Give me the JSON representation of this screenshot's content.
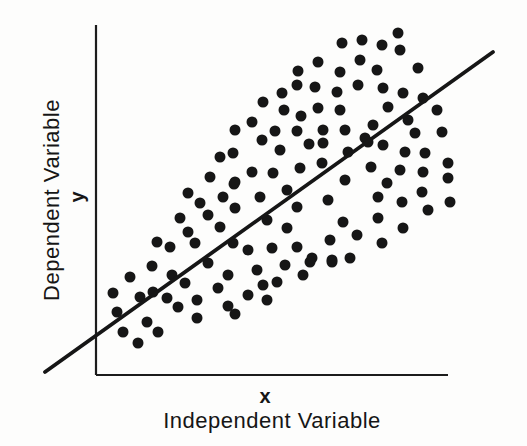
{
  "chart_data": {
    "type": "scatter",
    "title": "",
    "xlabel": "Independent Variable",
    "x_symbol": "x",
    "ylabel": "Dependent Variable",
    "y_symbol": "y",
    "legend": "none",
    "grid": false,
    "axes_note": "conceptual diagram: no ticks, no numeric scale; positive linear trend line through widening scatter cloud",
    "colors": {
      "background": "#fdfdfc",
      "ink": "#161616"
    },
    "axis_px": {
      "y_axis": {
        "x": 96,
        "y_top": 25,
        "y_bottom": 375
      },
      "x_axis": {
        "y": 375,
        "x_left": 96,
        "x_right": 448
      }
    },
    "trend_line_px": {
      "x1": 45,
      "y1": 372,
      "x2": 493,
      "y2": 52
    },
    "marker": {
      "shape": "circle",
      "radius_px": 5.5,
      "color": "#161616"
    },
    "labels_px": {
      "ylabel_center": {
        "x": 51,
        "y": 200
      },
      "y_symbol_center": {
        "x": 77,
        "y": 197
      },
      "x_symbol_center": {
        "x": 265,
        "y": 396
      },
      "xlabel_center": {
        "x": 272,
        "y": 417
      }
    },
    "points_px": [
      [
        398,
        33
      ],
      [
        342,
        43
      ],
      [
        362,
        40
      ],
      [
        382,
        45
      ],
      [
        400,
        50
      ],
      [
        318,
        62
      ],
      [
        360,
        60
      ],
      [
        298,
        71
      ],
      [
        340,
        72
      ],
      [
        377,
        70
      ],
      [
        418,
        68
      ],
      [
        297,
        85
      ],
      [
        315,
        87
      ],
      [
        337,
        92
      ],
      [
        358,
        85
      ],
      [
        282,
        93
      ],
      [
        383,
        88
      ],
      [
        403,
        93
      ],
      [
        423,
        98
      ],
      [
        263,
        102
      ],
      [
        284,
        110
      ],
      [
        318,
        108
      ],
      [
        340,
        110
      ],
      [
        388,
        107
      ],
      [
        437,
        110
      ],
      [
        252,
        122
      ],
      [
        301,
        116
      ],
      [
        235,
        130
      ],
      [
        275,
        131
      ],
      [
        297,
        131
      ],
      [
        323,
        130
      ],
      [
        345,
        130
      ],
      [
        373,
        125
      ],
      [
        408,
        120
      ],
      [
        415,
        133
      ],
      [
        442,
        132
      ],
      [
        262,
        140
      ],
      [
        309,
        144
      ],
      [
        365,
        138
      ],
      [
        280,
        150
      ],
      [
        323,
        143
      ],
      [
        348,
        152
      ],
      [
        368,
        142
      ],
      [
        383,
        145
      ],
      [
        405,
        152
      ],
      [
        425,
        153
      ],
      [
        448,
        163
      ],
      [
        220,
        157
      ],
      [
        233,
        153
      ],
      [
        210,
        177
      ],
      [
        188,
        193
      ],
      [
        234,
        184
      ],
      [
        252,
        172
      ],
      [
        273,
        173
      ],
      [
        300,
        168
      ],
      [
        322,
        163
      ],
      [
        345,
        180
      ],
      [
        371,
        167
      ],
      [
        400,
        170
      ],
      [
        423,
        172
      ],
      [
        448,
        178
      ],
      [
        235,
        182
      ],
      [
        287,
        190
      ],
      [
        387,
        183
      ],
      [
        422,
        192
      ],
      [
        200,
        203
      ],
      [
        223,
        197
      ],
      [
        180,
        218
      ],
      [
        208,
        215
      ],
      [
        220,
        227
      ],
      [
        260,
        197
      ],
      [
        297,
        207
      ],
      [
        235,
        208
      ],
      [
        267,
        220
      ],
      [
        287,
        228
      ],
      [
        328,
        200
      ],
      [
        343,
        222
      ],
      [
        378,
        197
      ],
      [
        402,
        202
      ],
      [
        450,
        202
      ],
      [
        428,
        210
      ],
      [
        378,
        218
      ],
      [
        403,
        228
      ],
      [
        330,
        240
      ],
      [
        357,
        235
      ],
      [
        382,
        243
      ],
      [
        248,
        250
      ],
      [
        272,
        248
      ],
      [
        297,
        247
      ],
      [
        312,
        258
      ],
      [
        332,
        260
      ],
      [
        350,
        258
      ],
      [
        157,
        242
      ],
      [
        170,
        247
      ],
      [
        195,
        243
      ],
      [
        188,
        232
      ],
      [
        233,
        243
      ],
      [
        152,
        266
      ],
      [
        172,
        275
      ],
      [
        130,
        277
      ],
      [
        185,
        283
      ],
      [
        208,
        263
      ],
      [
        228,
        275
      ],
      [
        257,
        270
      ],
      [
        285,
        265
      ],
      [
        310,
        262
      ],
      [
        332,
        262
      ],
      [
        277,
        282
      ],
      [
        303,
        275
      ],
      [
        263,
        285
      ],
      [
        218,
        288
      ],
      [
        113,
        293
      ],
      [
        140,
        297
      ],
      [
        153,
        292
      ],
      [
        167,
        298
      ],
      [
        197,
        300
      ],
      [
        248,
        295
      ],
      [
        267,
        300
      ],
      [
        117,
        312
      ],
      [
        178,
        307
      ],
      [
        197,
        318
      ],
      [
        228,
        306
      ],
      [
        235,
        314
      ],
      [
        147,
        322
      ],
      [
        123,
        332
      ],
      [
        158,
        332
      ],
      [
        138,
        343
      ]
    ]
  }
}
